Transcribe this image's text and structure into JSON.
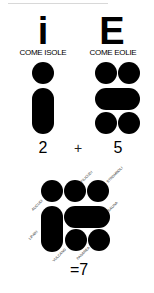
{
  "left": {
    "letter": "i",
    "caption": "COME ISOLE",
    "count": "2"
  },
  "operator": "+",
  "right": {
    "letter": "E",
    "caption": "COME EOLIE",
    "count": "5"
  },
  "result": "=7",
  "islands": [
    {
      "name": "ALICUDI"
    },
    {
      "name": "FILICUDI"
    },
    {
      "name": "STROMBOLI"
    },
    {
      "name": "SALINA"
    },
    {
      "name": "LIPARI"
    },
    {
      "name": "VULCANO"
    },
    {
      "name": "PANAREA"
    }
  ],
  "colors": {
    "shape": "#000000",
    "background": "#ffffff"
  }
}
